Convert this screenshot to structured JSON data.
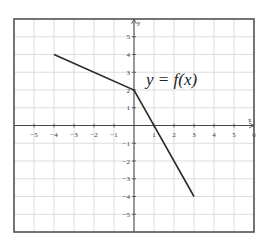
{
  "chart_data": {
    "type": "line",
    "title": "",
    "xlabel": "x",
    "ylabel": "y",
    "xlim": [
      -6,
      6
    ],
    "ylim": [
      -6,
      6
    ],
    "grid": true,
    "x_ticks": [
      -5,
      -4,
      -3,
      -2,
      -1,
      1,
      2,
      3,
      4,
      5,
      6
    ],
    "y_ticks": [
      5,
      4,
      3,
      2,
      1,
      -1,
      -2,
      -3,
      -4,
      -5
    ],
    "series": [
      {
        "name": "y = f(x)",
        "x": [
          -4,
          0,
          3
        ],
        "y": [
          4,
          2,
          -4
        ]
      }
    ],
    "annotations": [
      {
        "text": "y = f(x)",
        "x": 0.4,
        "y": 2.4
      }
    ]
  },
  "labels": {
    "function": "y = f(x)",
    "x_axis": "x",
    "y_axis": "y"
  },
  "colors": {
    "grid": "#cfcfcf",
    "axis": "#444444",
    "frame": "#555555",
    "line": "#2a2a2a"
  }
}
